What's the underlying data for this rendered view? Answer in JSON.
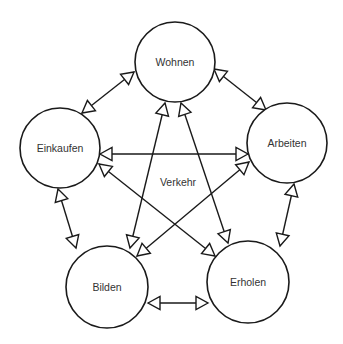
{
  "diagram": {
    "center_label": "Verkehr",
    "nodes": [
      {
        "id": "wohnen",
        "label": "Wohnen",
        "cx": 175,
        "cy": 62,
        "r": 40
      },
      {
        "id": "einkaufen",
        "label": "Einkaufen",
        "cx": 60,
        "cy": 148,
        "r": 40
      },
      {
        "id": "arbeiten",
        "label": "Arbeiten",
        "cx": 287,
        "cy": 143,
        "r": 40
      },
      {
        "id": "bilden",
        "label": "Bilden",
        "cx": 107,
        "cy": 287,
        "r": 41
      },
      {
        "id": "erholen",
        "label": "Erholen",
        "cx": 248,
        "cy": 282,
        "r": 41
      }
    ],
    "edges": [
      {
        "from": "wohnen",
        "to": "einkaufen",
        "bidirectional": true,
        "x1": 134,
        "y1": 72,
        "x2": 82,
        "y2": 113
      },
      {
        "from": "wohnen",
        "to": "arbeiten",
        "bidirectional": true,
        "x1": 214,
        "y1": 69,
        "x2": 266,
        "y2": 110
      },
      {
        "from": "wohnen",
        "to": "bilden",
        "bidirectional": true,
        "x1": 165,
        "y1": 103,
        "x2": 130,
        "y2": 248
      },
      {
        "from": "wohnen",
        "to": "erholen",
        "bidirectional": true,
        "x1": 181,
        "y1": 103,
        "x2": 228,
        "y2": 243
      },
      {
        "from": "einkaufen",
        "to": "arbeiten",
        "bidirectional": true,
        "x1": 100,
        "y1": 154,
        "x2": 248,
        "y2": 154
      },
      {
        "from": "einkaufen",
        "to": "erholen",
        "bidirectional": true,
        "x1": 99,
        "y1": 164,
        "x2": 215,
        "y2": 256
      },
      {
        "from": "arbeiten",
        "to": "bilden",
        "bidirectional": true,
        "x1": 249,
        "y1": 162,
        "x2": 137,
        "y2": 256
      },
      {
        "from": "einkaufen",
        "to": "bilden",
        "bidirectional": true,
        "x1": 58,
        "y1": 189,
        "x2": 76,
        "y2": 248
      },
      {
        "from": "arbeiten",
        "to": "erholen",
        "bidirectional": true,
        "x1": 294,
        "y1": 184,
        "x2": 280,
        "y2": 246
      },
      {
        "from": "bilden",
        "to": "erholen",
        "bidirectional": true,
        "x1": 148,
        "y1": 303,
        "x2": 208,
        "y2": 303
      }
    ]
  },
  "colors": {
    "stroke": "#1a1a1a",
    "text": "#333333",
    "background": "#ffffff"
  }
}
